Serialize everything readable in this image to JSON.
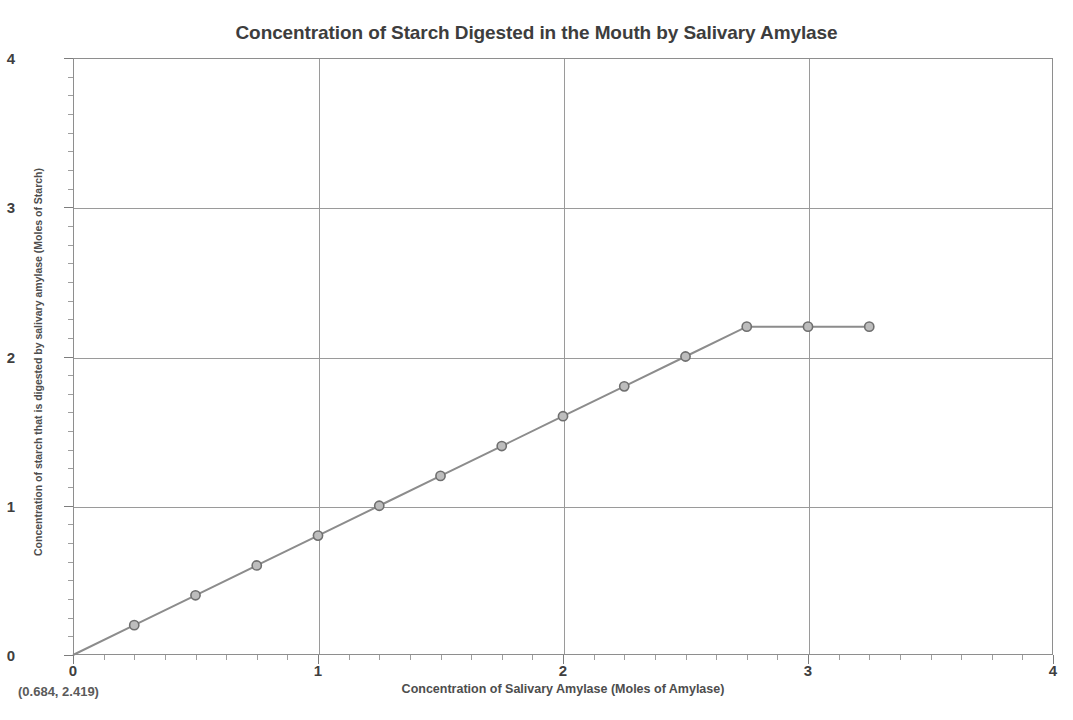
{
  "chart_data": {
    "type": "line",
    "title": "Concentration of Starch Digested in the Mouth by Salivary Amylase",
    "xlabel": "Concentration of Salivary Amylase (Moles of Amylase)",
    "ylabel": "Concentration of starch that is digested by salivary amylase (Moles of Starch)",
    "xlim": [
      0,
      4
    ],
    "ylim": [
      0,
      4
    ],
    "xticks": [
      0,
      1,
      2,
      3,
      4
    ],
    "yticks": [
      0,
      1,
      2,
      3,
      4
    ],
    "xtick_labels": [
      "0",
      "1",
      "2",
      "3",
      "4"
    ],
    "ytick_labels": [
      "0",
      "1",
      "2",
      "3",
      "4"
    ],
    "xminor_step": 0.125,
    "yminor_step": 0.125,
    "grid": true,
    "legend": "none",
    "annotations": [
      {
        "text": "(0.684, 2.419)",
        "position": "below-axis-left"
      }
    ],
    "series": [
      {
        "name": "Starch digested",
        "marker": "circle",
        "line_color": "#8c8c8c",
        "marker_face_color": "#bdbdbd",
        "marker_edge_color": "#6f6f6f",
        "x": [
          0,
          0.25,
          0.5,
          0.75,
          1.0,
          1.25,
          1.5,
          1.75,
          2.0,
          2.25,
          2.5,
          2.75,
          3.0,
          3.25
        ],
        "y": [
          0,
          0.2,
          0.4,
          0.6,
          0.8,
          1.0,
          1.2,
          1.4,
          1.6,
          1.8,
          2.0,
          2.2,
          2.2,
          2.2
        ]
      }
    ]
  },
  "annotation": {
    "coordinate_readout": "(0.684, 2.419)"
  }
}
